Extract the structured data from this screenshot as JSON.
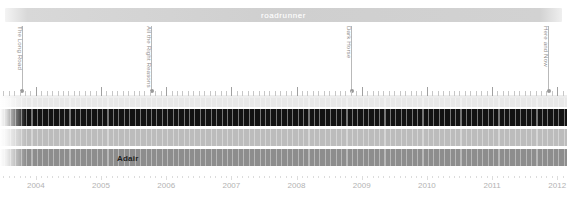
{
  "window": {
    "title": "roadrunner"
  },
  "chart_data": {
    "type": "timeline",
    "title": "roadrunner",
    "xlabel": "",
    "ylabel": "",
    "xlim": [
      2003.45,
      2012.15
    ],
    "grid": false,
    "legend": "none",
    "x_tick_labels": [
      "2004",
      "2005",
      "2006",
      "2007",
      "2008",
      "2009",
      "2010",
      "2011",
      "2012"
    ],
    "x_tick_values": [
      2004,
      2005,
      2006,
      2007,
      2008,
      2009,
      2010,
      2011,
      2012
    ],
    "annotations": [
      {
        "label": "The Long Road",
        "x": 2003.78
      },
      {
        "label": "All the Right Reasons",
        "x": 2005.77
      },
      {
        "label": "Dark Horse",
        "x": 2008.84
      },
      {
        "label": "Here and Now",
        "x": 2011.86
      }
    ],
    "rows": [
      {
        "name": "row-1",
        "color": "#e8e8e8",
        "start": 2003.45,
        "end": 2012.15,
        "label": ""
      },
      {
        "name": "row-2",
        "color": "#121212",
        "start": 2003.45,
        "end": 2012.15,
        "label": ""
      },
      {
        "name": "row-3",
        "color": "#bcbcbc",
        "start": 2003.45,
        "end": 2012.15,
        "label": ""
      },
      {
        "name": "row-4",
        "color": "#8d8d8d",
        "start": 2003.45,
        "end": 2012.15,
        "label": "Adair"
      }
    ]
  },
  "colors": {
    "titlebar": "#d0d0d0",
    "title_text": "#ffffff",
    "annotation_text": "#8e8e8e",
    "annotation_line": "#b9b9b9",
    "axis_text": "#b3b3b3",
    "tick": "#c7c7c7",
    "band_dark": "#121212",
    "band_light": "#e8e8e8",
    "band_mid": "#bcbcbc",
    "band_gray": "#8d8d8d",
    "row_label_text": "#1e1e1e"
  }
}
